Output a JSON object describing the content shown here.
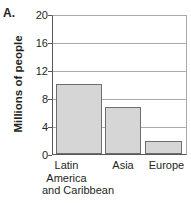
{
  "panel": {
    "letter": "A."
  },
  "chart_data": {
    "type": "bar",
    "title": "",
    "xlabel": "",
    "ylabel": "Millions of people",
    "ylim": [
      0,
      20
    ],
    "yticks": [
      "0",
      "4",
      "8",
      "12",
      "16",
      "20"
    ],
    "grid": true,
    "legend": "none",
    "categories": [
      "Latin America and Caribbean",
      "Asia",
      "Europe"
    ],
    "category_lines": [
      [
        "Latin",
        "America",
        "and Caribbean"
      ],
      [
        "Asia"
      ],
      [
        "Europe"
      ]
    ],
    "values": [
      10.0,
      6.7,
      1.9
    ],
    "bar_fill": "#d6d6d6",
    "bar_edge": "#6d6e71",
    "axis_color": "#58595b",
    "grid_color": "#a7a9ac"
  }
}
